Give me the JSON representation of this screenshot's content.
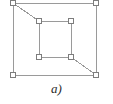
{
  "figure": {
    "caption": "a)",
    "colors": {
      "edge": "#9a9a9a",
      "node_stroke": "#7d7d7d",
      "node_fill": "#ffffff",
      "background": "#ffffff",
      "caption_text": "#2b2b2b"
    },
    "style": {
      "edge_width": 1,
      "node_size": 5,
      "node_shape": "square"
    }
  },
  "chart_data": {
    "type": "diagram",
    "subtitle": "",
    "xlabel": "",
    "ylabel": "",
    "grid": false,
    "legend": "none",
    "xlim": [
      0,
      113
    ],
    "ylim": [
      0,
      104
    ],
    "node_count": 8,
    "edge_count": 10,
    "nodes": [
      {
        "id": "O1",
        "label": "",
        "group": "outer",
        "x": 13,
        "y": 3
      },
      {
        "id": "O2",
        "label": "",
        "group": "outer",
        "x": 96,
        "y": 3
      },
      {
        "id": "O3",
        "label": "",
        "group": "outer",
        "x": 96,
        "y": 75
      },
      {
        "id": "O4",
        "label": "",
        "group": "outer",
        "x": 13,
        "y": 75
      },
      {
        "id": "I1",
        "label": "",
        "group": "inner",
        "x": 39,
        "y": 21
      },
      {
        "id": "I2",
        "label": "",
        "group": "inner",
        "x": 71,
        "y": 21
      },
      {
        "id": "I3",
        "label": "",
        "group": "inner",
        "x": 71,
        "y": 57
      },
      {
        "id": "I4",
        "label": "",
        "group": "inner",
        "x": 39,
        "y": 57
      }
    ],
    "edges": [
      {
        "from": "O1",
        "to": "O2",
        "kind": "outer-square-top"
      },
      {
        "from": "O2",
        "to": "O3",
        "kind": "outer-square-right"
      },
      {
        "from": "O3",
        "to": "O4",
        "kind": "outer-square-bottom"
      },
      {
        "from": "O4",
        "to": "O1",
        "kind": "outer-square-left"
      },
      {
        "from": "I1",
        "to": "I2",
        "kind": "inner-square-top"
      },
      {
        "from": "I2",
        "to": "I3",
        "kind": "inner-square-right"
      },
      {
        "from": "I3",
        "to": "I4",
        "kind": "inner-square-bottom"
      },
      {
        "from": "I4",
        "to": "I1",
        "kind": "inner-square-left"
      },
      {
        "from": "O1",
        "to": "I1",
        "kind": "diagonal-top-left"
      },
      {
        "from": "I3",
        "to": "O3",
        "kind": "diagonal-bottom-right"
      }
    ]
  }
}
